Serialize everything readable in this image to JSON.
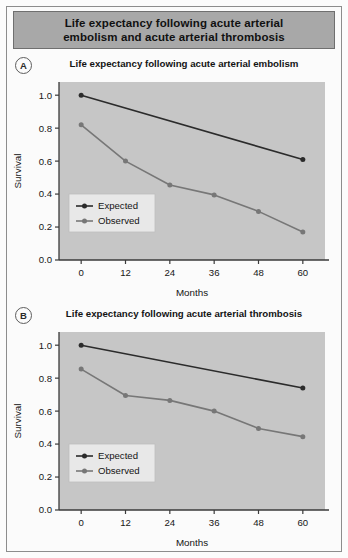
{
  "figure": {
    "title": "Life expectancy following acute arterial embolism and acute arterial thrombosis",
    "title_line_1": "Life expectancy following acute arterial",
    "title_line_2": "embolism and acute arterial thrombosis"
  },
  "panels": [
    {
      "badge": "A",
      "title": "Life expectancy following acute arterial embolism"
    },
    {
      "badge": "B",
      "title": "Life expectancy following acute arterial thrombosis"
    }
  ],
  "colors": {
    "plot_background": "#c6c6c6",
    "expected_series": "#2b2b2b",
    "observed_series": "#777777",
    "axis": "#3a3a3a",
    "banner_background": "#a8a8a8",
    "figure_border": "#8d8d8d",
    "legend_background": "#e8e8e8"
  },
  "axis_labels": {
    "x": "Months",
    "y": "Survival"
  },
  "legend": {
    "expected": "Expected",
    "observed": "Observed"
  },
  "chart_data": [
    {
      "type": "line",
      "title": "Life expectancy following acute arterial embolism",
      "panel": "A",
      "xlabel": "Months",
      "ylabel": "Survival",
      "x": [
        0,
        12,
        24,
        36,
        48,
        60
      ],
      "xticks": [
        "0",
        "12",
        "24",
        "36",
        "48",
        "60"
      ],
      "yticks": [
        "0.0",
        "0.2",
        "0.4",
        "0.6",
        "0.8",
        "1.0"
      ],
      "xlim": [
        -6,
        66
      ],
      "ylim": [
        0.0,
        1.08
      ],
      "grid": false,
      "legend_position": "lower-left",
      "series": [
        {
          "name": "Expected",
          "color": "#2b2b2b",
          "x": [
            0,
            60
          ],
          "values": [
            1.0,
            0.61
          ],
          "markers": [
            0,
            60
          ]
        },
        {
          "name": "Observed",
          "color": "#777777",
          "x": [
            0,
            12,
            24,
            36,
            48,
            60
          ],
          "values": [
            0.82,
            0.6,
            0.455,
            0.395,
            0.295,
            0.17
          ],
          "markers": [
            0,
            12,
            24,
            36,
            48,
            60
          ]
        }
      ]
    },
    {
      "type": "line",
      "title": "Life expectancy following acute arterial thrombosis",
      "panel": "B",
      "xlabel": "Months",
      "ylabel": "Survival",
      "x": [
        0,
        12,
        24,
        36,
        48,
        60
      ],
      "xticks": [
        "0",
        "12",
        "24",
        "36",
        "48",
        "60"
      ],
      "yticks": [
        "0.0",
        "0.2",
        "0.4",
        "0.6",
        "0.8",
        "1.0"
      ],
      "xlim": [
        -6,
        66
      ],
      "ylim": [
        0.0,
        1.08
      ],
      "grid": false,
      "legend_position": "lower-left",
      "series": [
        {
          "name": "Expected",
          "color": "#2b2b2b",
          "x": [
            0,
            60
          ],
          "values": [
            1.0,
            0.74
          ],
          "markers": [
            0,
            60
          ]
        },
        {
          "name": "Observed",
          "color": "#777777",
          "x": [
            0,
            12,
            24,
            36,
            48,
            60
          ],
          "values": [
            0.855,
            0.695,
            0.665,
            0.6,
            0.495,
            0.445
          ],
          "markers": [
            0,
            12,
            24,
            36,
            48,
            60
          ]
        }
      ]
    }
  ]
}
